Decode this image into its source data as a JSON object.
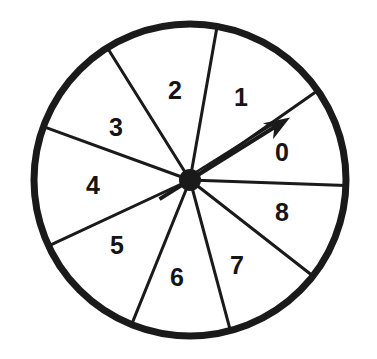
{
  "figure": {
    "name": "spinner-wheel",
    "background_color": "#ffffff",
    "ink_color": "#1a1a1a"
  },
  "wheel": {
    "center_x": 190,
    "center_y": 180,
    "radius": 156,
    "rim_width": 7,
    "rim_color": "#1a1a1a",
    "face_color": "#ffffff",
    "spoke_color": "#1a1a1a",
    "spoke_width": 3,
    "hub_radius": 11,
    "hub_color": "#1a1a1a",
    "sector_count": 9
  },
  "pointer": {
    "name": "spinner-arrow",
    "angle_degrees": 32,
    "length": 118,
    "tail_length": 36,
    "color": "#1a1a1a",
    "shaft_width": 4,
    "head_length": 26,
    "head_width": 19,
    "points_at": "0"
  },
  "sectors": [
    {
      "label": "0",
      "start_angle": -2,
      "end_angle": 35,
      "label_x": 282,
      "label_y": 161
    },
    {
      "label": "1",
      "start_angle": 35,
      "end_angle": 80,
      "label_x": 241,
      "label_y": 106
    },
    {
      "label": "2",
      "start_angle": 80,
      "end_angle": 122,
      "label_x": 175,
      "label_y": 99
    },
    {
      "label": "3",
      "start_angle": 122,
      "end_angle": 160,
      "label_x": 116,
      "label_y": 136
    },
    {
      "label": "4",
      "start_angle": 160,
      "end_angle": 205,
      "label_x": 93,
      "label_y": 194
    },
    {
      "label": "5",
      "start_angle": 205,
      "end_angle": 248,
      "label_x": 117,
      "label_y": 254
    },
    {
      "label": "6",
      "start_angle": 248,
      "end_angle": 285,
      "label_x": 177,
      "label_y": 286
    },
    {
      "label": "7",
      "start_angle": 285,
      "end_angle": 322,
      "label_x": 237,
      "label_y": 274
    },
    {
      "label": "8",
      "start_angle": 322,
      "end_angle": 358,
      "label_x": 282,
      "label_y": 221
    }
  ],
  "chart_data": {
    "type": "pie",
    "categories": [
      "0",
      "1",
      "2",
      "3",
      "4",
      "5",
      "6",
      "7",
      "8"
    ],
    "values": [
      37,
      45,
      42,
      38,
      45,
      43,
      37,
      37,
      36
    ],
    "units": "degrees",
    "legend": "none",
    "grid": false,
    "annotations": [
      "arrow pointer at 32 degrees indicating sector 0"
    ]
  }
}
